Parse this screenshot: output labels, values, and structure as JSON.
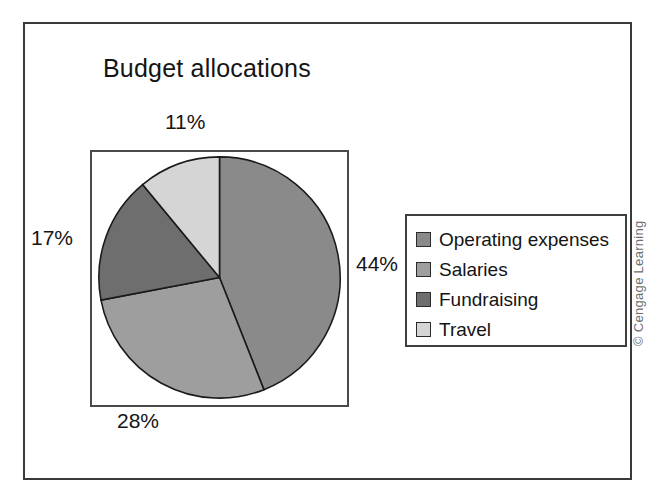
{
  "figure": {
    "title": "Budget allocations",
    "credit": "© Cengage Learning"
  },
  "legend": {
    "items": [
      {
        "label": "Operating expenses",
        "color": "#8a8a8a"
      },
      {
        "label": "Salaries",
        "color": "#9e9e9e"
      },
      {
        "label": "Fundraising",
        "color": "#6e6e6e"
      },
      {
        "label": "Travel",
        "color": "#d5d5d5"
      }
    ]
  },
  "labels": {
    "operating": "44%",
    "salaries": "28%",
    "fundraising": "17%",
    "travel": "11%"
  },
  "chart_data": {
    "type": "pie",
    "title": "Budget allocations",
    "categories": [
      "Operating expenses",
      "Salaries",
      "Fundraising",
      "Travel"
    ],
    "values": [
      44,
      28,
      17,
      11
    ],
    "value_labels": [
      "44%",
      "28%",
      "17%",
      "11%"
    ],
    "unit": "percent",
    "total": 100,
    "colors": [
      "#8a8a8a",
      "#9e9e9e",
      "#6e6e6e",
      "#d5d5d5"
    ],
    "start_angle_deg": 0,
    "direction": "clockwise",
    "legend_position": "right",
    "grid": false,
    "slice_border_color": "#1a1a1a"
  }
}
